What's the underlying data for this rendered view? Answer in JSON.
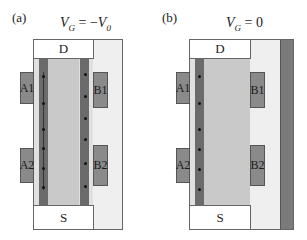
{
  "panels": [
    {
      "label": "(a)",
      "condition": {
        "var": "V",
        "sub": "G",
        "eq": " = −",
        "rhs": "V",
        "rhs_sub": "0"
      },
      "top_contact": "D",
      "bottom_contact": "S",
      "gates": [
        "A1",
        "A2",
        "B1",
        "B2"
      ],
      "channels": "both edges conducting",
      "dots_left": 6,
      "dots_right": 6
    },
    {
      "label": "(b)",
      "condition": {
        "var": "V",
        "sub": "G",
        "eq": " = 0"
      },
      "top_contact": "D",
      "bottom_contact": "S",
      "gates": [
        "A1",
        "A2",
        "B1",
        "B2"
      ],
      "channels": "left edge conducting only",
      "dots_left": 6
    }
  ],
  "colors": {
    "frame_bg": "#efefef",
    "channel_body": "#c9c9c9",
    "channel_edge": "#6b6b6b",
    "gate": "#8a8a8a",
    "contact": "#ffffff"
  }
}
